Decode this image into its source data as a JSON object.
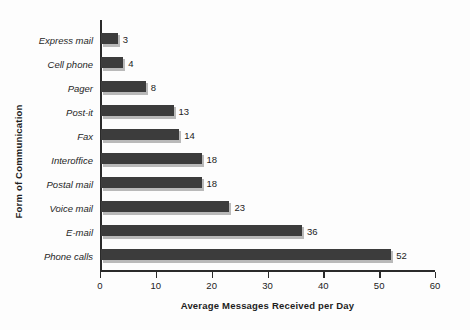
{
  "chart_data": {
    "type": "bar",
    "orientation": "horizontal",
    "title": "",
    "xlabel": "Average Messages Received per Day",
    "ylabel": "Form of Communication",
    "xlim": [
      0,
      60
    ],
    "xticks": [
      0,
      10,
      20,
      30,
      40,
      50,
      60
    ],
    "grid": false,
    "legend": null,
    "categories": [
      "Express mail",
      "Cell phone",
      "Pager",
      "Post-it",
      "Fax",
      "Interoffice",
      "Postal mail",
      "Voice mail",
      "E-mail",
      "Phone calls"
    ],
    "values": [
      3,
      4,
      8,
      13,
      14,
      18,
      18,
      23,
      36,
      52
    ],
    "data_labels": [
      "3",
      "4",
      "8",
      "13",
      "14",
      "18",
      "18",
      "23",
      "36",
      "52"
    ],
    "colors": {
      "bar_fill": "#3c3c3c",
      "bar_shadow": "#b9b9b9",
      "axis": "#2a2a2a",
      "background": "#fdfdfd",
      "text": "#1e1e1e"
    }
  }
}
